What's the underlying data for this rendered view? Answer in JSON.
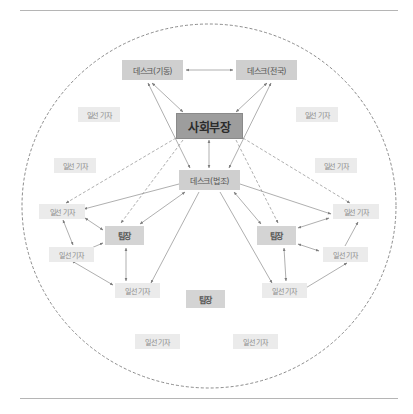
{
  "diagram": {
    "type": "organization-network",
    "colors": {
      "chief_fill": "#9d9d9d",
      "desk_fill": "#cfcfcf",
      "leader_fill": "#d4d4d4",
      "reporter_fill": "#ebebeb",
      "line": "#8c8c8c",
      "boundary": "#6f6f6f"
    },
    "nodes": {
      "desk_mobile": {
        "label": "데스크(기동)"
      },
      "desk_national": {
        "label": "데스크(전국)"
      },
      "chief": {
        "label": "사회부장"
      },
      "desk_legal": {
        "label": "데스크(법조)"
      },
      "leader_left": {
        "label": "팀장"
      },
      "leader_right": {
        "label": "팀장"
      },
      "leader_bottom": {
        "label": "팀장"
      },
      "reporters": [
        {
          "label": "일선 기자"
        },
        {
          "label": "일선 기자"
        },
        {
          "label": "일선 기자"
        },
        {
          "label": "일선 기자"
        },
        {
          "label": "일선 기자"
        },
        {
          "label": "일선 기자"
        },
        {
          "label": "일선 기자"
        },
        {
          "label": "일선 기자"
        },
        {
          "label": "일선 기자"
        },
        {
          "label": "일선 기자"
        },
        {
          "label": "일선 기자"
        },
        {
          "label": "일선 기자"
        }
      ]
    },
    "edges": [
      {
        "from": "데스크(기동)",
        "to": "데스크(전국)",
        "style": "solid",
        "arrows": "both"
      },
      {
        "from": "데스크(기동)",
        "to": "사회부장",
        "style": "solid",
        "arrows": "both"
      },
      {
        "from": "데스크(전국)",
        "to": "사회부장",
        "style": "solid",
        "arrows": "both"
      },
      {
        "from": "데스크(기동)",
        "to": "데스크(법조)",
        "style": "solid",
        "arrows": "both"
      },
      {
        "from": "데스크(전국)",
        "to": "데스크(법조)",
        "style": "solid",
        "arrows": "both"
      },
      {
        "from": "사회부장",
        "to": "데스크(법조)",
        "style": "solid",
        "arrows": "both"
      },
      {
        "from": "사회부장",
        "to": "일선 기자",
        "style": "dashed",
        "arrows": "end"
      },
      {
        "from": "사회부장",
        "to": "팀장",
        "style": "dashed",
        "arrows": "end"
      },
      {
        "from": "데스크(법조)",
        "to": "팀장",
        "style": "solid",
        "arrows": "both"
      },
      {
        "from": "데스크(법조)",
        "to": "일선 기자",
        "style": "solid",
        "arrows": "end"
      },
      {
        "from": "팀장",
        "to": "일선 기자",
        "style": "solid",
        "arrows": "both"
      },
      {
        "from": "일선 기자",
        "to": "일선 기자",
        "style": "solid",
        "arrows": "both"
      }
    ],
    "boundary": {
      "shape": "circle",
      "style": "dashed"
    }
  }
}
